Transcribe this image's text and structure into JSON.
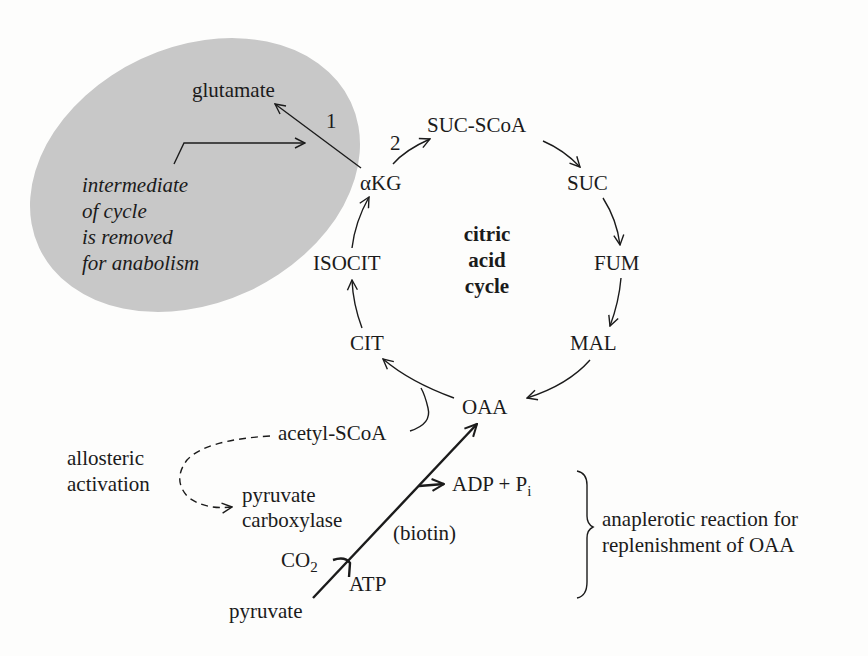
{
  "figure": {
    "center_label": [
      "citric",
      "acid",
      "cycle"
    ],
    "cycle_intermediates": [
      "OAA",
      "CIT",
      "ISOCIT",
      "αKG",
      "SUC-SCoA",
      "SUC",
      "FUM",
      "MAL"
    ],
    "removal_region": {
      "product": "glutamate",
      "step_labels": [
        "1",
        "2"
      ],
      "note": [
        "intermediate",
        "of cycle",
        "is removed",
        "for anabolism"
      ],
      "fill_color": "#c8c8c8"
    },
    "acetyl_entry": "acetyl-SCoA",
    "allosteric": {
      "label": [
        "allosteric",
        "activation"
      ],
      "enzyme": [
        "pyruvate",
        "carboxylase"
      ]
    },
    "anaplerotic": {
      "substrate": "pyruvate",
      "co2": "CO",
      "co2_sub": "2",
      "atp": "ATP",
      "cofactor": "(biotin)",
      "products": "ADP + P",
      "products_sub": "i",
      "brace_label": [
        "anaplerotic reaction for",
        "replenishment of OAA"
      ]
    }
  }
}
